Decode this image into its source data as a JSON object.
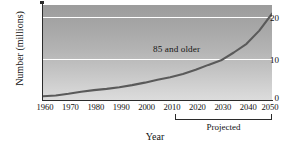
{
  "chart_data": {
    "type": "line",
    "title": "",
    "xlabel": "Year",
    "ylabel": "Number (millions)",
    "xlim": [
      1960,
      2050
    ],
    "ylim": [
      0,
      23
    ],
    "grid": true,
    "gridlines_y": [
      10,
      20
    ],
    "legend_position": "inline-annotation",
    "x_ticks": [
      1960,
      1970,
      1980,
      1990,
      2000,
      2010,
      2020,
      2030,
      2040,
      2050
    ],
    "x_tick_labels": [
      "1960",
      "1970",
      "1980",
      "1990",
      "2000",
      "2010",
      "2020",
      "2030",
      "2040",
      "2050"
    ],
    "y_ticks": [
      0,
      10,
      20
    ],
    "y_tick_labels": [
      "0",
      "10",
      "20"
    ],
    "series": [
      {
        "name": "85 and older",
        "color": "#5a5a5a",
        "x": [
          1960,
          1965,
          1970,
          1975,
          1980,
          1985,
          1990,
          1995,
          2000,
          2005,
          2010,
          2015,
          2020,
          2025,
          2030,
          2035,
          2040,
          2045,
          2050
        ],
        "values": [
          0.9,
          1.1,
          1.5,
          2.0,
          2.4,
          2.7,
          3.1,
          3.6,
          4.2,
          4.9,
          5.5,
          6.3,
          7.3,
          8.5,
          9.6,
          11.5,
          13.6,
          16.8,
          20.9
        ]
      }
    ],
    "annotations": [
      {
        "text": "85 and older",
        "x": 2025,
        "y": 12.8
      },
      {
        "text": "Projected",
        "x": 2030,
        "y": -4
      }
    ],
    "brackets": [
      {
        "label": "Projected",
        "from": 2010,
        "to": 2050
      }
    ]
  },
  "axes": {
    "y_title": "Number (millions)",
    "x_title": "Year",
    "y_tick_labels": [
      "0",
      "10",
      "20"
    ],
    "x_tick_labels": [
      "1960",
      "1970",
      "1980",
      "1990",
      "2000",
      "2010",
      "2020",
      "2030",
      "2040",
      "2050"
    ]
  },
  "annotations": {
    "series_label": "85 and older",
    "projected_label": "Projected"
  },
  "colors": {
    "curve": "#5a5a5a",
    "gridline": "#ffffff",
    "axis": "#2b2b2b",
    "plot_top": "#9c9c9c",
    "plot_bottom": "#dcdcdc",
    "page_background": "#ffffff"
  }
}
